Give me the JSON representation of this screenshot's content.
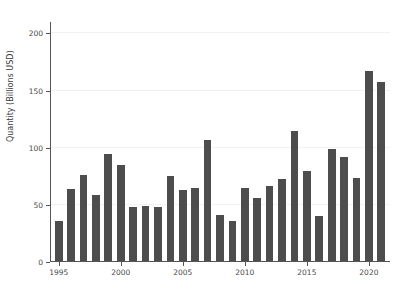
{
  "chart_data": {
    "type": "bar",
    "title": "",
    "xlabel": "",
    "ylabel": "Quantity (Billions USD)",
    "categories": [
      1995,
      1996,
      1997,
      1998,
      1999,
      2000,
      2001,
      2002,
      2003,
      2004,
      2005,
      2006,
      2007,
      2008,
      2009,
      2010,
      2011,
      2012,
      2013,
      2014,
      2015,
      2016,
      2017,
      2018,
      2019,
      2020,
      2021
    ],
    "values": [
      35,
      63,
      75,
      58,
      94,
      84,
      47,
      48,
      47,
      74,
      62,
      64,
      106,
      40,
      35,
      64,
      55,
      66,
      72,
      114,
      79,
      39,
      98,
      91,
      73,
      166,
      157
    ],
    "xlim": [
      1994.3,
      2021.7
    ],
    "ylim": [
      0,
      210
    ],
    "ytick_values": [
      0,
      50,
      100,
      150,
      200
    ],
    "ytick_labels": [
      "0",
      "50",
      "100",
      "150",
      "200"
    ],
    "xtick_values": [
      1995,
      2000,
      2005,
      2010,
      2015,
      2020
    ],
    "xtick_labels": [
      "1995",
      "2000",
      "2005",
      "2010",
      "2015",
      "2020"
    ],
    "grid": true,
    "grid_axis": "y",
    "legend": null,
    "bar_color": "#4d4d4d",
    "grid_color": "#f2f2f2",
    "axis_color": "#555555",
    "background_color": "#ffffff",
    "bar_width_fraction": 0.62
  }
}
